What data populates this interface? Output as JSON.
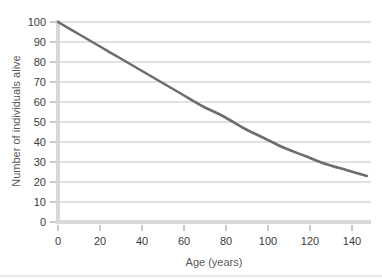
{
  "chart_data": {
    "type": "line",
    "title": "",
    "subtitle": "",
    "xlabel": "Age (years)",
    "ylabel": "Number of individuals alive",
    "xlim": [
      0,
      152
    ],
    "ylim": [
      0,
      100
    ],
    "xticks": [
      0,
      20,
      40,
      60,
      80,
      100,
      120,
      140
    ],
    "xticklabels": [
      "0",
      "20",
      "40",
      "60",
      "80",
      "100",
      "120",
      "140"
    ],
    "yticks": [
      0,
      10,
      20,
      30,
      40,
      50,
      60,
      70,
      80,
      90,
      100
    ],
    "yticklabels": [
      "0",
      "10",
      "20",
      "30",
      "40",
      "50",
      "60",
      "70",
      "80",
      "90",
      "100"
    ],
    "grid": "horizontal",
    "legend": "none",
    "series": [
      {
        "name": "Number of individuals alive",
        "color": "#6d6d6f",
        "x": [
          0,
          10,
          20,
          30,
          40,
          50,
          60,
          70,
          80,
          90,
          100,
          110,
          120,
          130,
          140,
          150
        ],
        "values": [
          100,
          94,
          88,
          82,
          76,
          70,
          64,
          58,
          53,
          47,
          42,
          37,
          33,
          29,
          26,
          23
        ]
      }
    ],
    "annotations": []
  },
  "axes": {
    "y_axis_label": "Number of individuals alive",
    "x_axis_label": "Age (years)"
  },
  "colors": {
    "curve": "#6d6d6f",
    "gridline": "#a9a9ab",
    "axis": "#d8d8d8",
    "tick_text": "#3a3a3c",
    "axis_label_text": "#58585a",
    "background": "#ffffff"
  }
}
